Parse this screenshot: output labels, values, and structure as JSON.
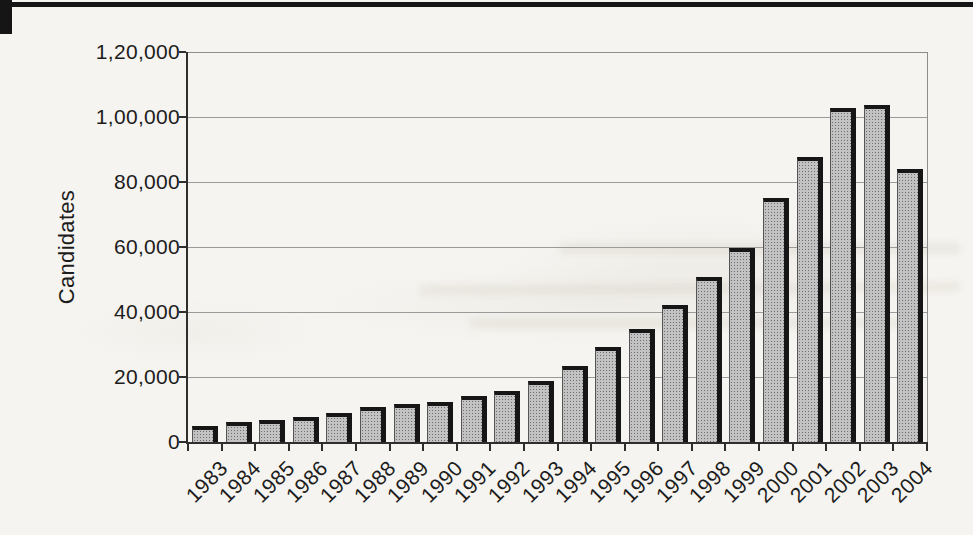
{
  "chart_data": {
    "type": "bar",
    "title": "",
    "ylabel": "Candidates",
    "xlabel": "",
    "categories": [
      "1983",
      "1984",
      "1985",
      "1986",
      "1987",
      "1988",
      "1989",
      "1990",
      "1991",
      "1992",
      "1993",
      "1994",
      "1995",
      "1996",
      "1997",
      "1998",
      "1999",
      "2000",
      "2001",
      "2002",
      "2003",
      "2004"
    ],
    "values": [
      5000,
      6200,
      6800,
      7700,
      8900,
      10700,
      11600,
      12400,
      14000,
      15800,
      18900,
      23300,
      29300,
      34700,
      42200,
      50800,
      59700,
      75000,
      87700,
      102700,
      103800,
      84000
    ],
    "ylim": [
      0,
      120000
    ],
    "ytick_step": 20000,
    "ytick_labels": [
      "0",
      "20,000",
      "40,000",
      "60,000",
      "80,000",
      "1,00,000",
      "1,20,000"
    ],
    "grid": true,
    "legend": "none",
    "x_tick_label_rotation_deg": 45,
    "number_format": "indian-lakh"
  },
  "colors": {
    "paper": "#f6f4f0",
    "bar_fill": "#c2c2c2",
    "bar_dot": "#6f6f6f",
    "bar_shadow": "#161616",
    "axis": "#2e2e2e",
    "gridline": "#9a9a9a",
    "text": "#1c1c1c",
    "top_rule": "#151515"
  }
}
